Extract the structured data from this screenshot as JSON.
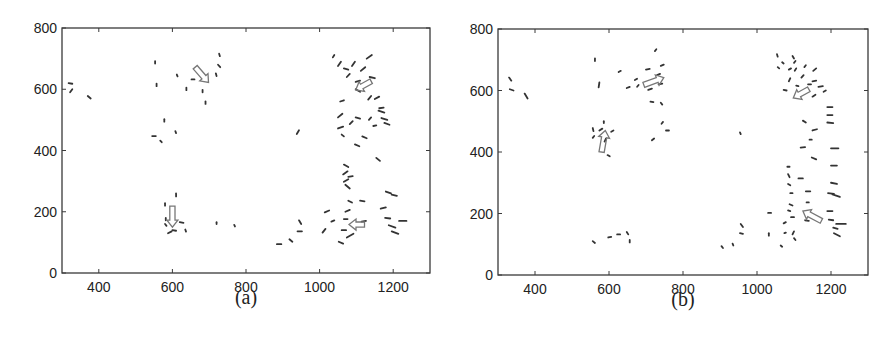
{
  "figure": {
    "panels": [
      {
        "caption": "(a)",
        "frame": {
          "left": 62,
          "top": 28,
          "right": 430,
          "bottom": 273
        }
      },
      {
        "caption": "(b)",
        "frame": {
          "left": 498,
          "top": 29,
          "right": 868,
          "bottom": 275
        }
      }
    ],
    "colors": {
      "frame": "#3a3a3a",
      "vector": "#333333",
      "arrow": "#777777",
      "text": "#222222"
    }
  },
  "chart_data": [
    {
      "type": "scatter",
      "subtype": "vector-field (short oriented line segments) with large hollow summary arrows",
      "title": "(a)",
      "xlabel": "",
      "ylabel": "",
      "xlim": [
        300,
        1300
      ],
      "ylim": [
        0,
        800
      ],
      "xticks": [
        400,
        600,
        800,
        1000,
        1200
      ],
      "yticks": [
        0,
        200,
        400,
        600,
        800
      ],
      "grid": false,
      "segments": [
        [
          318,
          620,
          328,
          618
        ],
        [
          322,
          590,
          328,
          600
        ],
        [
          370,
          578,
          378,
          570
        ],
        [
          553,
          692,
          553,
          684
        ],
        [
          557,
          618,
          557,
          610
        ],
        [
          612,
          648,
          614,
          642
        ],
        [
          638,
          605,
          638,
          597
        ],
        [
          652,
          632,
          660,
          632
        ],
        [
          682,
          598,
          682,
          590
        ],
        [
          690,
          560,
          690,
          552
        ],
        [
          718,
          652,
          720,
          643
        ],
        [
          724,
          680,
          730,
          672
        ],
        [
          727,
          716,
          729,
          708
        ],
        [
          578,
          502,
          578,
          494
        ],
        [
          545,
          447,
          555,
          447
        ],
        [
          567,
          432,
          571,
          427
        ],
        [
          608,
          463,
          610,
          457
        ],
        [
          610,
          260,
          610,
          250
        ],
        [
          580,
          228,
          580,
          220
        ],
        [
          582,
          180,
          582,
          172
        ],
        [
          580,
          160,
          584,
          154
        ],
        [
          588,
          130,
          598,
          136
        ],
        [
          600,
          140,
          610,
          138
        ],
        [
          620,
          166,
          630,
          164
        ],
        [
          635,
          142,
          637,
          135
        ],
        [
          720,
          166,
          720,
          160
        ],
        [
          768,
          157,
          770,
          152
        ],
        [
          938,
          454,
          944,
          466
        ],
        [
          884,
          94,
          896,
          94
        ],
        [
          918,
          110,
          926,
          102
        ],
        [
          940,
          136,
          952,
          136
        ],
        [
          944,
          172,
          950,
          160
        ],
        [
          1008,
          132,
          1016,
          144
        ],
        [
          1014,
          198,
          1026,
          204
        ],
        [
          1032,
          168,
          1040,
          172
        ],
        [
          1052,
          102,
          1064,
          96
        ],
        [
          1060,
          140,
          1072,
          140
        ],
        [
          1066,
          176,
          1076,
          176
        ],
        [
          1070,
          200,
          1082,
          206
        ],
        [
          1078,
          236,
          1088,
          230
        ],
        [
          1074,
          116,
          1092,
          128
        ],
        [
          1110,
          236,
          1122,
          234
        ],
        [
          1114,
          168,
          1126,
          170
        ],
        [
          1166,
          210,
          1180,
          214
        ],
        [
          1178,
          180,
          1192,
          178
        ],
        [
          1180,
          266,
          1194,
          260
        ],
        [
          1196,
          256,
          1210,
          252
        ],
        [
          1188,
          156,
          1206,
          148
        ],
        [
          1196,
          136,
          1214,
          128
        ],
        [
          1216,
          170,
          1236,
          170
        ],
        [
          1070,
          288,
          1082,
          276
        ],
        [
          1066,
          354,
          1078,
          346
        ],
        [
          1064,
          322,
          1076,
          332
        ],
        [
          1078,
          314,
          1090,
          316
        ],
        [
          1066,
          298,
          1078,
          306
        ],
        [
          1096,
          420,
          1108,
          414
        ],
        [
          1116,
          446,
          1128,
          440
        ],
        [
          1154,
          376,
          1164,
          366
        ],
        [
          1050,
          472,
          1064,
          478
        ],
        [
          1060,
          452,
          1066,
          446
        ],
        [
          1050,
          508,
          1062,
          520
        ],
        [
          1056,
          560,
          1066,
          564
        ],
        [
          1082,
          486,
          1090,
          496
        ],
        [
          1098,
          508,
          1110,
          504
        ],
        [
          1134,
          500,
          1140,
          508
        ],
        [
          1146,
          480,
          1154,
          482
        ],
        [
          1160,
          530,
          1176,
          524
        ],
        [
          1168,
          506,
          1184,
          500
        ],
        [
          1176,
          490,
          1190,
          484
        ],
        [
          1036,
          704,
          1040,
          712
        ],
        [
          1050,
          676,
          1058,
          690
        ],
        [
          1066,
          668,
          1078,
          664
        ],
        [
          1074,
          640,
          1082,
          650
        ],
        [
          1088,
          676,
          1096,
          690
        ],
        [
          1098,
          600,
          1110,
          592
        ],
        [
          1098,
          624,
          1110,
          628
        ],
        [
          1112,
          660,
          1124,
          672
        ],
        [
          1128,
          700,
          1142,
          712
        ],
        [
          1132,
          566,
          1140,
          578
        ],
        [
          1136,
          640,
          1150,
          636
        ],
        [
          1150,
          568,
          1162,
          576
        ],
        [
          1162,
          538,
          1174,
          540
        ]
      ],
      "arrows": [
        {
          "from": [
            662,
            672
          ],
          "to": [
            698,
            622
          ],
          "label": "down-right"
        },
        {
          "from": [
            1140,
            626
          ],
          "to": [
            1098,
            598
          ],
          "label": "down-left"
        },
        {
          "from": [
            600,
            218
          ],
          "to": [
            600,
            150
          ],
          "label": "down"
        },
        {
          "from": [
            1122,
            158
          ],
          "to": [
            1080,
            158
          ],
          "label": "left"
        }
      ]
    },
    {
      "type": "scatter",
      "subtype": "vector-field (short oriented line segments) with large hollow summary arrows",
      "title": "(b)",
      "xlabel": "",
      "ylabel": "",
      "xlim": [
        300,
        1300
      ],
      "ylim": [
        0,
        800
      ],
      "xticks": [
        400,
        600,
        800,
        1000,
        1200
      ],
      "yticks": [
        0,
        200,
        400,
        600,
        800
      ],
      "grid": false,
      "segments": [
        [
          330,
          642,
          336,
          632
        ],
        [
          332,
          604,
          342,
          600
        ],
        [
          372,
          590,
          380,
          574
        ],
        [
          562,
          704,
          562,
          696
        ],
        [
          572,
          610,
          574,
          626
        ],
        [
          626,
          660,
          632,
          664
        ],
        [
          648,
          608,
          656,
          612
        ],
        [
          670,
          634,
          676,
          638
        ],
        [
          676,
          612,
          680,
          618
        ],
        [
          700,
          668,
          710,
          670
        ],
        [
          706,
          602,
          716,
          606
        ],
        [
          712,
          564,
          720,
          562
        ],
        [
          724,
          728,
          728,
          734
        ],
        [
          730,
          650,
          738,
          654
        ],
        [
          740,
          680,
          748,
          684
        ],
        [
          740,
          560,
          744,
          554
        ],
        [
          734,
          620,
          744,
          622
        ],
        [
          556,
          478,
          558,
          468
        ],
        [
          556,
          446,
          560,
          452
        ],
        [
          586,
          500,
          586,
          494
        ],
        [
          574,
          470,
          582,
          476
        ],
        [
          606,
          466,
          612,
          470
        ],
        [
          588,
          434,
          592,
          444
        ],
        [
          596,
          390,
          602,
          386
        ],
        [
          716,
          438,
          722,
          444
        ],
        [
          742,
          492,
          746,
          498
        ],
        [
          754,
          470,
          762,
          470
        ],
        [
          556,
          110,
          562,
          104
        ],
        [
          598,
          122,
          606,
          124
        ],
        [
          622,
          132,
          630,
          132
        ],
        [
          648,
          140,
          652,
          132
        ],
        [
          656,
          114,
          656,
          106
        ],
        [
          904,
          94,
          908,
          88
        ],
        [
          934,
          102,
          936,
          96
        ],
        [
          954,
          136,
          962,
          134
        ],
        [
          956,
          166,
          962,
          156
        ],
        [
          954,
          464,
          956,
          458
        ],
        [
          1030,
          202,
          1038,
          202
        ],
        [
          1032,
          136,
          1032,
          128
        ],
        [
          1064,
          96,
          1068,
          92
        ],
        [
          1072,
          168,
          1078,
          172
        ],
        [
          1074,
          136,
          1078,
          138
        ],
        [
          1084,
          210,
          1090,
          208
        ],
        [
          1096,
          132,
          1100,
          142
        ],
        [
          1100,
          120,
          1104,
          114
        ],
        [
          1088,
          230,
          1096,
          226
        ],
        [
          1090,
          266,
          1096,
          266
        ],
        [
          1084,
          296,
          1090,
          292
        ],
        [
          1084,
          328,
          1088,
          318
        ],
        [
          1082,
          352,
          1088,
          352
        ],
        [
          1092,
          188,
          1100,
          188
        ],
        [
          1112,
          314,
          1124,
          314
        ],
        [
          1132,
          272,
          1144,
          272
        ],
        [
          1130,
          178,
          1140,
          176
        ],
        [
          1134,
          236,
          1140,
          236
        ],
        [
          1148,
          382,
          1160,
          376
        ],
        [
          1150,
          470,
          1162,
          474
        ],
        [
          1142,
          440,
          1148,
          440
        ],
        [
          1124,
          502,
          1132,
          496
        ],
        [
          1118,
          414,
          1130,
          416
        ],
        [
          1190,
          208,
          1204,
          208
        ],
        [
          1194,
          180,
          1206,
          178
        ],
        [
          1192,
          266,
          1208,
          264
        ],
        [
          1200,
          300,
          1216,
          296
        ],
        [
          1206,
          154,
          1218,
          150
        ],
        [
          1208,
          136,
          1224,
          126
        ],
        [
          1214,
          166,
          1240,
          166
        ],
        [
          1200,
          356,
          1216,
          356
        ],
        [
          1200,
          412,
          1220,
          412
        ],
        [
          1190,
          496,
          1206,
          494
        ],
        [
          1190,
          520,
          1204,
          520
        ],
        [
          1190,
          546,
          1204,
          546
        ],
        [
          1204,
          262,
          1224,
          254
        ],
        [
          1054,
          718,
          1056,
          710
        ],
        [
          1056,
          676,
          1060,
          672
        ],
        [
          1068,
          692,
          1072,
          688
        ],
        [
          1072,
          602,
          1080,
          600
        ],
        [
          1086,
          630,
          1090,
          640
        ],
        [
          1086,
          668,
          1092,
          672
        ],
        [
          1096,
          712,
          1100,
          704
        ],
        [
          1100,
          690,
          1104,
          696
        ],
        [
          1102,
          664,
          1106,
          672
        ],
        [
          1106,
          616,
          1112,
          614
        ],
        [
          1120,
          642,
          1126,
          650
        ],
        [
          1128,
          676,
          1132,
          682
        ],
        [
          1138,
          620,
          1146,
          620
        ],
        [
          1150,
          630,
          1160,
          632
        ],
        [
          1150,
          580,
          1158,
          586
        ],
        [
          1152,
          664,
          1160,
          672
        ],
        [
          1166,
          612,
          1178,
          614
        ],
        [
          1180,
          596,
          1186,
          600
        ]
      ],
      "arrows": [
        {
          "from": [
            694,
            618
          ],
          "to": [
            748,
            642
          ],
          "label": "right"
        },
        {
          "from": [
            580,
            400
          ],
          "to": [
            590,
            470
          ],
          "label": "up"
        },
        {
          "from": [
            1140,
            604
          ],
          "to": [
            1098,
            576
          ],
          "label": "down-left"
        },
        {
          "from": [
            1174,
            176
          ],
          "to": [
            1124,
            208
          ],
          "label": "up-left"
        }
      ]
    }
  ]
}
